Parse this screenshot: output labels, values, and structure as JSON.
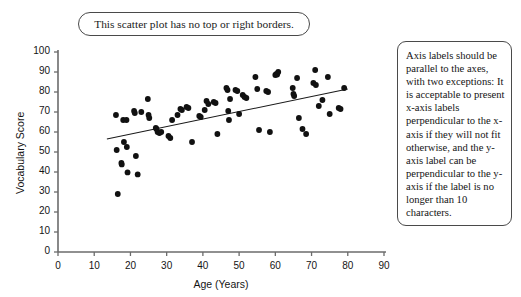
{
  "caption": {
    "text": "This scatter plot has no top or right borders."
  },
  "note": {
    "text": "Axis labels should be parallel to the axes, with two exceptions: It is acceptable to present x-axis labels perpendicular to the x-axis if they will not fit otherwise, and the y-axis label can be perpendicular to the y-axis if the label is no longer than 10 characters."
  },
  "colors": {
    "axis": "#6b6b6b",
    "point": "#111111",
    "line": "#1a1a1a",
    "border": "#4a4a4a",
    "background": "#ffffff"
  },
  "chart_data": {
    "type": "scatter",
    "title": "",
    "xlabel": "Age (Years)",
    "ylabel": "Vocabulary Score",
    "xlim": [
      0,
      90
    ],
    "ylim": [
      0,
      100
    ],
    "xticks": [
      0,
      10,
      20,
      30,
      40,
      50,
      60,
      70,
      80,
      90
    ],
    "yticks": [
      0,
      10,
      20,
      30,
      40,
      50,
      60,
      70,
      80,
      90,
      100
    ],
    "grid": false,
    "legend": null,
    "spines": [
      "left",
      "bottom"
    ],
    "trendline": {
      "type": "linear",
      "x": [
        13.5,
        80.0
      ],
      "y": [
        56.5,
        81.5
      ]
    },
    "points": [
      [
        16.0,
        68.5
      ],
      [
        16.2,
        51.0
      ],
      [
        16.5,
        29.0
      ],
      [
        17.5,
        44.5
      ],
      [
        17.6,
        43.8
      ],
      [
        18.0,
        66.0
      ],
      [
        18.2,
        55.0
      ],
      [
        18.9,
        66.0
      ],
      [
        19.0,
        52.5
      ],
      [
        19.2,
        39.8
      ],
      [
        21.0,
        70.5
      ],
      [
        21.2,
        69.5
      ],
      [
        21.5,
        48.0
      ],
      [
        22.0,
        38.8
      ],
      [
        23.0,
        70.0
      ],
      [
        24.8,
        76.5
      ],
      [
        25.0,
        68.5
      ],
      [
        25.2,
        67.0
      ],
      [
        27.0,
        62.0
      ],
      [
        27.2,
        61.5
      ],
      [
        27.5,
        60.0
      ],
      [
        28.0,
        59.5
      ],
      [
        28.5,
        60.0
      ],
      [
        30.5,
        58.0
      ],
      [
        31.0,
        57.0
      ],
      [
        31.5,
        66.0
      ],
      [
        33.0,
        68.5
      ],
      [
        33.8,
        71.5
      ],
      [
        34.2,
        71.0
      ],
      [
        35.5,
        72.5
      ],
      [
        36.0,
        72.0
      ],
      [
        37.0,
        55.0
      ],
      [
        39.0,
        68.0
      ],
      [
        39.4,
        67.5
      ],
      [
        40.5,
        71.0
      ],
      [
        41.0,
        75.5
      ],
      [
        41.5,
        74.0
      ],
      [
        43.0,
        75.0
      ],
      [
        43.5,
        74.5
      ],
      [
        44.0,
        59.0
      ],
      [
        46.5,
        82.0
      ],
      [
        46.8,
        81.0
      ],
      [
        47.0,
        70.5
      ],
      [
        47.2,
        66.0
      ],
      [
        47.5,
        76.5
      ],
      [
        49.0,
        81.0
      ],
      [
        49.5,
        80.5
      ],
      [
        50.0,
        69.0
      ],
      [
        51.0,
        78.5
      ],
      [
        51.5,
        77.5
      ],
      [
        52.0,
        77.0
      ],
      [
        54.5,
        87.5
      ],
      [
        55.0,
        81.5
      ],
      [
        55.5,
        61.0
      ],
      [
        57.5,
        80.5
      ],
      [
        58.0,
        80.0
      ],
      [
        58.5,
        60.0
      ],
      [
        60.0,
        88.5
      ],
      [
        60.3,
        89.0
      ],
      [
        60.5,
        88.7
      ],
      [
        60.8,
        90.0
      ],
      [
        64.8,
        82.0
      ],
      [
        65.0,
        79.0
      ],
      [
        65.2,
        78.0
      ],
      [
        66.0,
        87.0
      ],
      [
        66.5,
        67.0
      ],
      [
        67.5,
        61.5
      ],
      [
        68.5,
        59.0
      ],
      [
        70.5,
        84.5
      ],
      [
        71.0,
        91.0
      ],
      [
        71.2,
        83.5
      ],
      [
        72.0,
        73.0
      ],
      [
        73.0,
        76.0
      ],
      [
        74.5,
        87.5
      ],
      [
        75.0,
        69.0
      ],
      [
        77.5,
        72.0
      ],
      [
        78.0,
        71.5
      ],
      [
        79.0,
        82.0
      ]
    ]
  }
}
